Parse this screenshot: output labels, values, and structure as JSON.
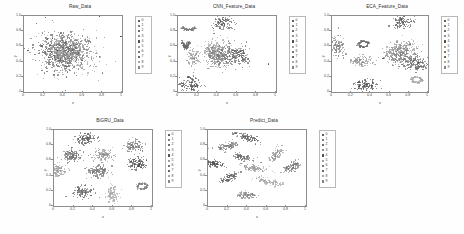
{
  "figure": {
    "background": "#fefefe",
    "class_labels": [
      "0",
      "1",
      "2",
      "3",
      "4",
      "5",
      "6",
      "7",
      "8",
      "9"
    ],
    "class_colors": [
      "#5b5b5b",
      "#7a7a7a",
      "#6a6a6a",
      "#8e8e8e",
      "#4f4f4f",
      "#9c9c9c",
      "#747474",
      "#626262",
      "#a6a6a6",
      "#858585"
    ]
  },
  "panels": [
    {
      "id": "raw-data",
      "title": "Raw_Data",
      "xlabel": "x",
      "ylabel": "y"
    },
    {
      "id": "cnn-feature-data",
      "title": "CNN_Feature_Data",
      "xlabel": "x",
      "ylabel": "y"
    },
    {
      "id": "eca-feature-data",
      "title": "ECA_Feature_Data",
      "xlabel": "x",
      "ylabel": "y"
    },
    {
      "id": "bigru-data",
      "title": "BiGRU_Data",
      "xlabel": "x",
      "ylabel": "y"
    },
    {
      "id": "predict-data",
      "title": "Predict_Data",
      "xlabel": "x",
      "ylabel": "y"
    }
  ],
  "axes_ticks": {
    "x": [
      "0",
      "0.2",
      "0.4",
      "0.6",
      "0.8",
      "1"
    ],
    "x_values": [
      0,
      0.2,
      0.4,
      0.6,
      0.8,
      1
    ],
    "y": [
      "0",
      "0.2",
      "0.4",
      "0.6",
      "0.8",
      "1.0"
    ],
    "y_values": [
      0,
      0.2,
      0.4,
      0.6,
      0.8,
      1.0
    ]
  },
  "chart_data": [
    {
      "type": "scatter",
      "title": "Raw_Data",
      "xlabel": "x",
      "ylabel": "y",
      "xlim": [
        0,
        1
      ],
      "ylim": [
        0,
        1
      ],
      "grid": false,
      "legend": "right-outside",
      "legend_entries": [
        "0",
        "1",
        "2",
        "3",
        "4",
        "5",
        "6",
        "7",
        "8",
        "9"
      ],
      "description": "All ten classes overlap in one dense unseparated blob centred near (0.42,0.52); a few sparse outliers near the plot corners.",
      "clusters": [
        {
          "label": "0",
          "center": [
            0.4,
            0.53
          ],
          "spread": [
            0.13,
            0.12
          ],
          "n": 110,
          "shape": "blob"
        },
        {
          "label": "1",
          "center": [
            0.43,
            0.5
          ],
          "spread": [
            0.13,
            0.12
          ],
          "n": 110,
          "shape": "blob"
        },
        {
          "label": "2",
          "center": [
            0.41,
            0.55
          ],
          "spread": [
            0.12,
            0.13
          ],
          "n": 110,
          "shape": "blob"
        },
        {
          "label": "3",
          "center": [
            0.44,
            0.52
          ],
          "spread": [
            0.13,
            0.11
          ],
          "n": 110,
          "shape": "blob"
        },
        {
          "label": "4",
          "center": [
            0.39,
            0.5
          ],
          "spread": [
            0.12,
            0.12
          ],
          "n": 110,
          "shape": "blob"
        },
        {
          "label": "5",
          "center": [
            0.42,
            0.56
          ],
          "spread": [
            0.13,
            0.12
          ],
          "n": 110,
          "shape": "blob"
        },
        {
          "label": "6",
          "center": [
            0.45,
            0.54
          ],
          "spread": [
            0.12,
            0.12
          ],
          "n": 110,
          "shape": "blob"
        },
        {
          "label": "7",
          "center": [
            0.38,
            0.54
          ],
          "spread": [
            0.13,
            0.12
          ],
          "n": 110,
          "shape": "blob"
        },
        {
          "label": "8",
          "center": [
            0.43,
            0.48
          ],
          "spread": [
            0.12,
            0.12
          ],
          "n": 110,
          "shape": "blob"
        },
        {
          "label": "9",
          "center": [
            0.41,
            0.51
          ],
          "spread": [
            0.13,
            0.13
          ],
          "n": 110,
          "shape": "blob"
        }
      ],
      "outliers": [
        [
          0.22,
          0.98
        ],
        [
          0.77,
          1.0
        ],
        [
          0.99,
          0.73
        ],
        [
          0.04,
          0.55
        ],
        [
          0.42,
          0.02
        ],
        [
          0.13,
          0.9
        ]
      ]
    },
    {
      "type": "scatter",
      "title": "CNN_Feature_Data",
      "xlabel": "x",
      "ylabel": "y",
      "xlim": [
        0,
        1
      ],
      "ylim": [
        0,
        1
      ],
      "grid": false,
      "legend": "right-outside",
      "legend_entries": [
        "0",
        "1",
        "2",
        "3",
        "4",
        "5",
        "6",
        "7",
        "8",
        "9"
      ],
      "description": "Partial separation: several round clusters emerge, but three large clusters near the centre still merge together; one curved arc at upper-left.",
      "clusters": [
        {
          "label": "0",
          "center": [
            0.46,
            0.9
          ],
          "spread": [
            0.055,
            0.055
          ],
          "n": 120,
          "shape": "blob"
        },
        {
          "label": "1",
          "center": [
            0.11,
            0.83
          ],
          "spread": [
            0.055,
            0.03
          ],
          "n": 90,
          "shape": "arc"
        },
        {
          "label": "2",
          "center": [
            0.08,
            0.62
          ],
          "spread": [
            0.03,
            0.065
          ],
          "n": 90,
          "shape": "arc"
        },
        {
          "label": "3",
          "center": [
            0.16,
            0.45
          ],
          "spread": [
            0.03,
            0.055
          ],
          "n": 90,
          "shape": "blob"
        },
        {
          "label": "4",
          "center": [
            0.13,
            0.09
          ],
          "spread": [
            0.055,
            0.055
          ],
          "n": 110,
          "shape": "blob"
        },
        {
          "label": "5",
          "center": [
            0.41,
            0.52
          ],
          "spread": [
            0.075,
            0.08
          ],
          "n": 160,
          "shape": "blob"
        },
        {
          "label": "6",
          "center": [
            0.47,
            0.46
          ],
          "spread": [
            0.07,
            0.075
          ],
          "n": 160,
          "shape": "blob"
        },
        {
          "label": "7",
          "center": [
            0.61,
            0.49
          ],
          "spread": [
            0.062,
            0.065
          ],
          "n": 150,
          "shape": "blob"
        },
        {
          "label": "8",
          "center": [
            0.34,
            0.56
          ],
          "spread": [
            0.035,
            0.035
          ],
          "n": 70,
          "shape": "blob"
        },
        {
          "label": "9",
          "center": [
            0.38,
            0.47
          ],
          "spread": [
            0.05,
            0.055
          ],
          "n": 110,
          "shape": "blob"
        }
      ],
      "outliers": [
        [
          0.92,
          0.37
        ]
      ]
    },
    {
      "type": "scatter",
      "title": "ECA_Feature_Data",
      "xlabel": "x",
      "ylabel": "y",
      "xlim": [
        0,
        1
      ],
      "ylim": [
        0,
        1
      ],
      "grid": false,
      "legend": "right-outside",
      "legend_entries": [
        "0",
        "1",
        "2",
        "3",
        "4",
        "5",
        "6",
        "7",
        "8",
        "9"
      ],
      "description": "Better separation than CNN: compact clusters on the left, a ring cluster near (0.33,0.63), but a large merged mass remains at the right between x 0.6 and 1.0.",
      "clusters": [
        {
          "label": "0",
          "center": [
            0.73,
            0.92
          ],
          "spread": [
            0.055,
            0.045
          ],
          "n": 120,
          "shape": "blob"
        },
        {
          "label": "1",
          "center": [
            0.06,
            0.6
          ],
          "spread": [
            0.03,
            0.075
          ],
          "n": 110,
          "shape": "blob"
        },
        {
          "label": "2",
          "center": [
            0.33,
            0.63
          ],
          "spread": [
            0.048,
            0.038
          ],
          "n": 90,
          "shape": "ring"
        },
        {
          "label": "3",
          "center": [
            0.31,
            0.41
          ],
          "spread": [
            0.055,
            0.035
          ],
          "n": 100,
          "shape": "blob"
        },
        {
          "label": "4",
          "center": [
            0.35,
            0.09
          ],
          "spread": [
            0.055,
            0.04
          ],
          "n": 110,
          "shape": "blob"
        },
        {
          "label": "5",
          "center": [
            0.74,
            0.58
          ],
          "spread": [
            0.07,
            0.05
          ],
          "n": 150,
          "shape": "blob"
        },
        {
          "label": "6",
          "center": [
            0.76,
            0.44
          ],
          "spread": [
            0.08,
            0.065
          ],
          "n": 170,
          "shape": "blob"
        },
        {
          "label": "7",
          "center": [
            0.9,
            0.36
          ],
          "spread": [
            0.055,
            0.05
          ],
          "n": 120,
          "shape": "blob"
        },
        {
          "label": "8",
          "center": [
            0.88,
            0.16
          ],
          "spread": [
            0.05,
            0.035
          ],
          "n": 90,
          "shape": "ring"
        },
        {
          "label": "9",
          "center": [
            0.66,
            0.5
          ],
          "spread": [
            0.05,
            0.055
          ],
          "n": 110,
          "shape": "blob"
        }
      ],
      "outliers": [
        [
          0.53,
          0.44
        ]
      ]
    },
    {
      "type": "scatter",
      "title": "BiGRU_Data",
      "xlabel": "x",
      "ylabel": "y",
      "xlim": [
        0,
        1
      ],
      "ylim": [
        0,
        1
      ],
      "grid": false,
      "legend": "right-outside",
      "legend_entries": [
        "0",
        "1",
        "2",
        "3",
        "4",
        "5",
        "6",
        "7",
        "8",
        "9"
      ],
      "description": "Ten well-separated compact round clusters spread evenly across the plot area; near-perfect class separation.",
      "clusters": [
        {
          "label": "0",
          "center": [
            0.33,
            0.88
          ],
          "spread": [
            0.05,
            0.04
          ],
          "n": 120,
          "shape": "blob"
        },
        {
          "label": "1",
          "center": [
            0.82,
            0.79
          ],
          "spread": [
            0.048,
            0.038
          ],
          "n": 115,
          "shape": "blob"
        },
        {
          "label": "2",
          "center": [
            0.18,
            0.66
          ],
          "spread": [
            0.05,
            0.04
          ],
          "n": 120,
          "shape": "blob"
        },
        {
          "label": "3",
          "center": [
            0.5,
            0.68
          ],
          "spread": [
            0.048,
            0.04
          ],
          "n": 120,
          "shape": "blob"
        },
        {
          "label": "4",
          "center": [
            0.85,
            0.56
          ],
          "spread": [
            0.048,
            0.038
          ],
          "n": 115,
          "shape": "blob"
        },
        {
          "label": "5",
          "center": [
            0.03,
            0.47
          ],
          "spread": [
            0.045,
            0.042
          ],
          "n": 110,
          "shape": "blob"
        },
        {
          "label": "6",
          "center": [
            0.46,
            0.46
          ],
          "spread": [
            0.052,
            0.042
          ],
          "n": 125,
          "shape": "blob"
        },
        {
          "label": "7",
          "center": [
            0.29,
            0.18
          ],
          "spread": [
            0.048,
            0.038
          ],
          "n": 115,
          "shape": "blob"
        },
        {
          "label": "8",
          "center": [
            0.6,
            0.16
          ],
          "spread": [
            0.03,
            0.055
          ],
          "n": 100,
          "shape": "blob"
        },
        {
          "label": "9",
          "center": [
            0.9,
            0.26
          ],
          "spread": [
            0.048,
            0.038
          ],
          "n": 105,
          "shape": "ring"
        }
      ],
      "outliers": []
    },
    {
      "type": "scatter",
      "title": "Predict_Data",
      "xlabel": "x",
      "ylabel": "y",
      "xlim": [
        0,
        1
      ],
      "ylim": [
        0,
        1
      ],
      "grid": false,
      "legend": "right-outside",
      "legend_entries": [
        "0",
        "1",
        "2",
        "3",
        "4",
        "5",
        "6",
        "7",
        "8",
        "9"
      ],
      "description": "Ten well-separated elongated streak-shaped clusters at varied orientations; classes fully resolved.",
      "clusters": [
        {
          "label": "0",
          "center": [
            0.41,
            0.9
          ],
          "spread": [
            0.07,
            0.022
          ],
          "n": 100,
          "shape": "streak",
          "angle": -25
        },
        {
          "label": "1",
          "center": [
            0.2,
            0.79
          ],
          "spread": [
            0.055,
            0.025
          ],
          "n": 95,
          "shape": "streak",
          "angle": 15
        },
        {
          "label": "2",
          "center": [
            0.35,
            0.64
          ],
          "spread": [
            0.06,
            0.022
          ],
          "n": 95,
          "shape": "streak",
          "angle": -18
        },
        {
          "label": "3",
          "center": [
            0.7,
            0.68
          ],
          "spread": [
            0.055,
            0.025
          ],
          "n": 90,
          "shape": "streak",
          "angle": 58
        },
        {
          "label": "4",
          "center": [
            0.05,
            0.56
          ],
          "spread": [
            0.055,
            0.022
          ],
          "n": 90,
          "shape": "streak",
          "angle": -10
        },
        {
          "label": "5",
          "center": [
            0.48,
            0.5
          ],
          "spread": [
            0.07,
            0.02
          ],
          "n": 100,
          "shape": "streak",
          "angle": -12
        },
        {
          "label": "6",
          "center": [
            0.86,
            0.52
          ],
          "spread": [
            0.055,
            0.028
          ],
          "n": 95,
          "shape": "streak",
          "angle": 38
        },
        {
          "label": "7",
          "center": [
            0.21,
            0.37
          ],
          "spread": [
            0.058,
            0.025
          ],
          "n": 95,
          "shape": "streak",
          "angle": 30
        },
        {
          "label": "8",
          "center": [
            0.62,
            0.32
          ],
          "spread": [
            0.07,
            0.022
          ],
          "n": 100,
          "shape": "streak",
          "angle": -20
        },
        {
          "label": "9",
          "center": [
            0.4,
            0.14
          ],
          "spread": [
            0.022,
            0.045
          ],
          "n": 85,
          "shape": "streak",
          "angle": 80
        }
      ],
      "outliers": []
    }
  ]
}
